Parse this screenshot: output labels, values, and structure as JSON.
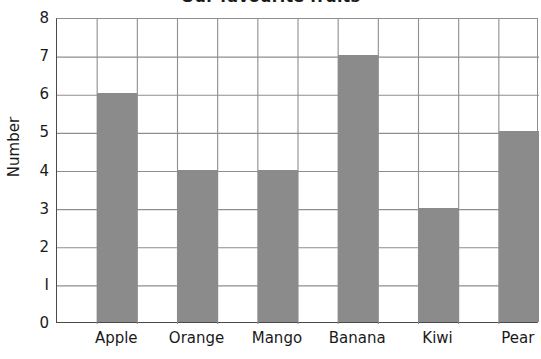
{
  "chart_data": {
    "type": "bar",
    "title": "Our favourite fruits",
    "xlabel": "",
    "ylabel": "Number",
    "categories": [
      "Apple",
      "Orange",
      "Mango",
      "Banana",
      "Kiwi",
      "Pear"
    ],
    "values": [
      6,
      4,
      4,
      7,
      3,
      5
    ],
    "ylim": [
      0,
      8
    ],
    "ytick_labels": [
      "8",
      "7",
      "6",
      "5",
      "4",
      "3",
      "2",
      "I",
      "0"
    ],
    "ytick_values": [
      8,
      7,
      6,
      5,
      4,
      3,
      2,
      1,
      0
    ],
    "grid": true,
    "grid_vertical_cells": 12,
    "legend": null,
    "bar_color": "#8b8b8b",
    "grid_color": "#8e8e8e",
    "axis_color": "#4a4a4a",
    "background": "#ffffff"
  }
}
